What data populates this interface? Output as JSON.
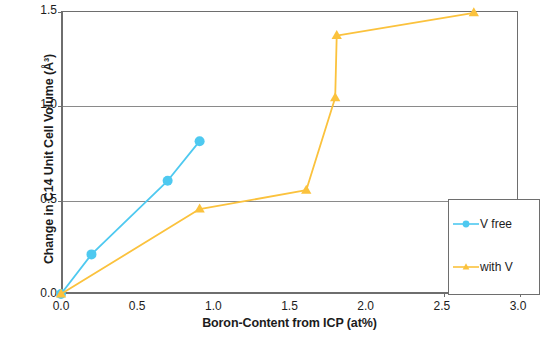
{
  "chart_data": {
    "type": "line",
    "title": "",
    "xlabel": "Boron-Content from ICP (at%)",
    "ylabel": "Change in C14 Unit Cell Volume (Å³)",
    "xlim": [
      0.0,
      3.0
    ],
    "ylim": [
      0.0,
      1.5
    ],
    "xticks": [
      "0.0",
      "0.5",
      "1.0",
      "1.5",
      "2.0",
      "2.5",
      "3.0"
    ],
    "xtick_values": [
      0.0,
      0.5,
      1.0,
      1.5,
      2.0,
      2.5,
      3.0
    ],
    "yticks": [
      "0.0",
      "0.5",
      "1.0",
      "1.5"
    ],
    "ytick_values": [
      0.0,
      0.5,
      1.0,
      1.5
    ],
    "grid": "horizontal",
    "gridlines_y": [
      0.5,
      1.0
    ],
    "legend_position": "bottom-right",
    "series": [
      {
        "name": "V free",
        "color": "#4ec9f0",
        "marker": "circle",
        "x": [
          0.0,
          0.2,
          0.7,
          0.91
        ],
        "y": [
          0.0,
          0.21,
          0.6,
          0.81
        ]
      },
      {
        "name": "with V",
        "color": "#fbc23d",
        "marker": "triangle",
        "x": [
          0.0,
          0.91,
          1.61,
          1.8,
          1.81,
          2.71
        ],
        "y": [
          0.0,
          0.45,
          0.55,
          1.04,
          1.37,
          1.49
        ]
      }
    ]
  },
  "axes": {
    "x_title": "Boron-Content from ICP (at%)",
    "y_title": "Change in C14 Unit Cell Volume (Å³)",
    "x_tick_labels": [
      "0.0",
      "0.5",
      "1.0",
      "1.5",
      "2.0",
      "2.5",
      "3.0"
    ],
    "y_tick_labels": [
      "0.0",
      "0.5",
      "1.0",
      "1.5"
    ]
  },
  "legend": {
    "entries": [
      {
        "label": "V free",
        "color": "#4ec9f0",
        "marker": "circle"
      },
      {
        "label": "with V",
        "color": "#fbc23d",
        "marker": "triangle"
      }
    ]
  },
  "colors": {
    "series_v_free": "#4ec9f0",
    "series_with_v": "#fbc23d",
    "axis": "#6e6e6e",
    "grid": "#8a8a8a",
    "text": "#1c1c1c",
    "background": "#ffffff"
  }
}
